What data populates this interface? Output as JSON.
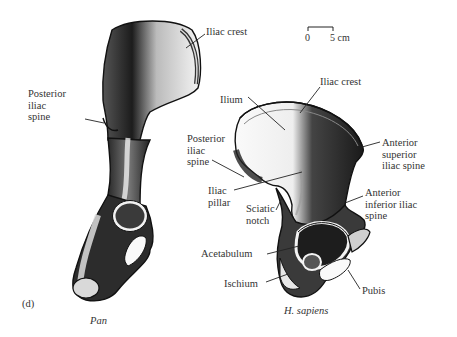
{
  "figure": {
    "panel_label": "(d)",
    "scale_bar": {
      "start": "0",
      "end": "5 cm"
    },
    "specimens": [
      {
        "caption": "Pan",
        "labels": {
          "iliac_crest": "Iliac crest",
          "posterior_iliac_spine": [
            "Posterior",
            "iliac",
            "spine"
          ]
        }
      },
      {
        "caption": "H. sapiens",
        "labels": {
          "iliac_crest": "Iliac crest",
          "ilium": "Ilium",
          "posterior_iliac_spine": [
            "Posterior",
            "iliac",
            "spine"
          ],
          "anterior_superior_iliac_spine": [
            "Anterior",
            "superior",
            "iliac spine"
          ],
          "iliac_pillar": [
            "Iliac",
            "pillar"
          ],
          "sciatic_notch": [
            "Sciatic",
            "notch"
          ],
          "anterior_inferior_iliac_spine": [
            "Anterior",
            "inferior iliac",
            "spine"
          ],
          "acetabulum": "Acetabulum",
          "pubis": "Pubis",
          "ischium": "Ischium"
        }
      }
    ]
  }
}
